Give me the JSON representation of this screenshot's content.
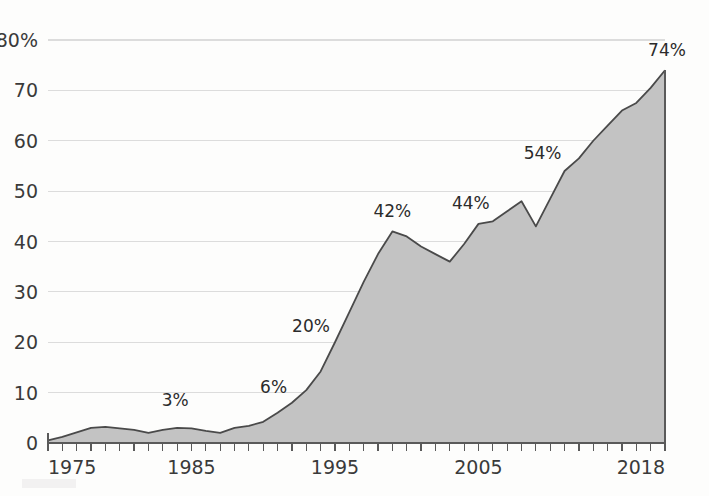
{
  "chart_data": {
    "type": "area",
    "title": "",
    "subtitle": "",
    "xlabel": "",
    "ylabel": "",
    "xlim": [
      1975,
      2018
    ],
    "ylim": [
      0,
      80
    ],
    "grid": true,
    "legend": "none",
    "y_ticks": [
      0,
      10,
      20,
      30,
      40,
      50,
      60,
      70,
      80
    ],
    "y_tick_labels": [
      "0",
      "10",
      "20",
      "30",
      "40",
      "50",
      "60",
      "70",
      "80%"
    ],
    "x_ticks": [
      1975,
      1985,
      1995,
      2005,
      2018
    ],
    "x_tick_labels": [
      "1975",
      "1985",
      "1995",
      "2005",
      "2018"
    ],
    "x": [
      1975,
      1976,
      1977,
      1978,
      1979,
      1980,
      1981,
      1982,
      1983,
      1984,
      1985,
      1986,
      1987,
      1988,
      1989,
      1990,
      1991,
      1992,
      1993,
      1994,
      1995,
      1996,
      1997,
      1998,
      1999,
      2000,
      2001,
      2002,
      2003,
      2004,
      2005,
      2006,
      2007,
      2008,
      2009,
      2010,
      2011,
      2012,
      2013,
      2014,
      2015,
      2016,
      2017,
      2018
    ],
    "values": [
      0.5,
      1.2,
      2.1,
      3.0,
      3.2,
      2.9,
      2.6,
      2.0,
      2.6,
      3.0,
      2.9,
      2.4,
      2.0,
      3.0,
      3.4,
      4.2,
      6.0,
      8.0,
      10.5,
      14.2,
      20.0,
      26.0,
      32.0,
      37.5,
      42.0,
      41.0,
      39.0,
      37.5,
      36.0,
      39.5,
      43.5,
      44.0,
      46.0,
      48.0,
      43.0,
      48.5,
      54.0,
      56.5,
      60.0,
      63.0,
      66.0,
      67.5,
      70.5,
      74.0
    ],
    "point_labels": [
      {
        "year": 1984,
        "value": 3.0,
        "text": "3%"
      },
      {
        "year": 1991,
        "value": 6.0,
        "text": "6%"
      },
      {
        "year": 1995,
        "value": 20.0,
        "text": "20%"
      },
      {
        "year": 1999,
        "value": 42.0,
        "text": "42%"
      },
      {
        "year": 2006,
        "value": 44.0,
        "text": "44%"
      },
      {
        "year": 2011,
        "value": 54.0,
        "text": "54%"
      },
      {
        "year": 2018,
        "value": 74.0,
        "text": "74%"
      }
    ],
    "colors": {
      "area_fill": "#c3c3c3",
      "area_stroke": "#4a4a4a",
      "gridline": "#dcdcdc",
      "axis": "#5a5a5a",
      "text": "#3a3a3a",
      "background": "#fdfdfc"
    }
  }
}
